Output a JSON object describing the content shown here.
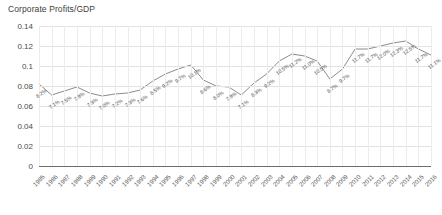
{
  "chart_data": {
    "type": "line",
    "title": "Corporate Profits/GDP",
    "xlabel": "",
    "ylabel": "",
    "ylim": [
      0,
      0.14
    ],
    "grid": true,
    "legend": false,
    "line_color": "#8c8c8c",
    "yticks": [
      "0",
      "0.02",
      "0.04",
      "0.06",
      "0.08",
      "0.1",
      "0.12",
      "0.14"
    ],
    "ytick_values": [
      0,
      0.02,
      0.04,
      0.06,
      0.08,
      0.1,
      0.12,
      0.14
    ],
    "categories": [
      "1985",
      "1986",
      "1987",
      "1988",
      "1989",
      "1990",
      "1991",
      "1992",
      "1993",
      "1994",
      "1995",
      "1996",
      "1997",
      "1998",
      "1999",
      "2000",
      "2001",
      "2002",
      "2003",
      "2004",
      "2005",
      "2006",
      "2007",
      "2008",
      "2009",
      "2010",
      "2011",
      "2012",
      "2013",
      "2014",
      "2015",
      "2016"
    ],
    "values": [
      0.082,
      0.071,
      0.075,
      0.079,
      0.073,
      0.07,
      0.072,
      0.073,
      0.076,
      0.085,
      0.092,
      0.097,
      0.101,
      0.086,
      0.08,
      0.079,
      0.071,
      0.083,
      0.092,
      0.105,
      0.112,
      0.11,
      0.105,
      0.087,
      0.097,
      0.117,
      0.117,
      0.12,
      0.123,
      0.125,
      0.117,
      0.111
    ],
    "data_labels": [
      "8.2%",
      "7.1%",
      "7.5%",
      "7.9%",
      "7.3%",
      "7.0%",
      "7.2%",
      "7.3%",
      "7.6%",
      "8.5%",
      "9.2%",
      "9.7%",
      "10.1%",
      "8.6%",
      "8.0%",
      "7.9%",
      "7.1%",
      "8.3%",
      "9.2%",
      "10.5%",
      "11.2%",
      "11.0%",
      "10.5%",
      "8.7%",
      "9.7%",
      "11.7%",
      "11.7%",
      "12.0%",
      "12.3%",
      "12.5%",
      "11.7%",
      "11.1%"
    ]
  }
}
